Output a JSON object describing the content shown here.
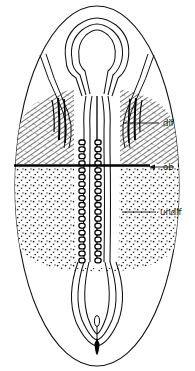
{
  "figure": {
    "type": "line-diagram",
    "background_color": "#ffffff",
    "ink_color": "#111111",
    "width": 195,
    "height": 371
  },
  "labels": [
    {
      "id": "dif",
      "text": "dif",
      "meaning": "differentiated region",
      "text_x": 163,
      "text_y": 123,
      "leader": {
        "x1": 123,
        "y1": 123,
        "x2": 159,
        "y2": 123,
        "arrow": false
      }
    },
    {
      "id": "ob",
      "text": "ob",
      "meaning": "oral boundary",
      "text_x": 163,
      "text_y": 167,
      "leader": {
        "x1": 174,
        "y1": 167,
        "x2": 150,
        "y2": 167,
        "arrow": true
      }
    },
    {
      "id": "undif",
      "text": "undif",
      "meaning": "undifferentiated region",
      "text_x": 160,
      "text_y": 212,
      "leader": {
        "x1": 122,
        "y1": 212,
        "x2": 156,
        "y2": 212,
        "arrow": false
      }
    }
  ],
  "regions": {
    "differentiated": {
      "name": "dif",
      "fill_pattern": "diagonal-hatch",
      "top_y": 98,
      "bottom_y": 165
    },
    "boundary": {
      "name": "ob",
      "style": "thick-horizontal-rule",
      "y": 165,
      "x_start": 14,
      "x_end": 150,
      "thickness": 2.4
    },
    "undifferentiated": {
      "name": "undif",
      "fill_pattern": "stipple-dots",
      "top_y": 166,
      "bottom_y": 265
    }
  },
  "structures": {
    "outer_body": "oval outline",
    "inner_organ": "anvil-shaped anterior cavity with paired ducts",
    "midline_segments": {
      "description": "paired vertical rows of rounded segment cells",
      "left_column_x": 82,
      "right_column_x": 98,
      "top_y": 140,
      "bottom_y": 265,
      "count_per_column": 18
    },
    "posterior_loop": "U-shaped duct loop",
    "terminal_spike": "dark elongated terminal stylet"
  }
}
